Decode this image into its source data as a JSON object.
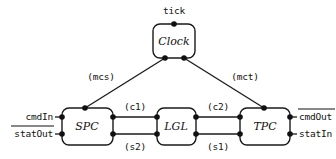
{
  "diagram": {
    "title": "tick",
    "components": [
      {
        "id": "clock",
        "label": "Clock"
      },
      {
        "id": "spc",
        "label": "SPC"
      },
      {
        "id": "lgl",
        "label": "LGL"
      },
      {
        "id": "tpc",
        "label": "TPC"
      }
    ],
    "channels": [
      {
        "id": "mcs",
        "label": "(mcs)",
        "from": "clock",
        "to": "spc"
      },
      {
        "id": "mct",
        "label": "(mct)",
        "from": "clock",
        "to": "tpc"
      },
      {
        "id": "c1",
        "label": "(c1)",
        "from": "spc",
        "to": "lgl"
      },
      {
        "id": "s2",
        "label": "(s2)",
        "from": "lgl",
        "to": "spc"
      },
      {
        "id": "c2",
        "label": "(c2)",
        "from": "lgl",
        "to": "tpc"
      },
      {
        "id": "s1",
        "label": "(s1)",
        "from": "tpc",
        "to": "lgl"
      }
    ],
    "external_ports": [
      {
        "id": "tick",
        "label": "tick",
        "overline": false,
        "side": "top"
      },
      {
        "id": "cmdin",
        "label": "cmdIn",
        "overline": false,
        "side": "left"
      },
      {
        "id": "statout",
        "label": "statOut",
        "overline": true,
        "side": "left"
      },
      {
        "id": "cmdout",
        "label": "cmdOut",
        "overline": true,
        "side": "right"
      },
      {
        "id": "statin",
        "label": "statIn",
        "overline": false,
        "side": "right"
      }
    ],
    "colors": {
      "stroke": "#1a1a1a",
      "port": "#111111",
      "background": "#ffffff"
    }
  }
}
